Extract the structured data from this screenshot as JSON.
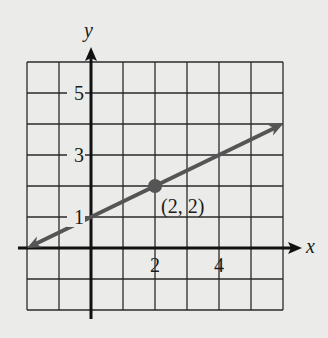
{
  "chart_data": {
    "type": "line",
    "title": "",
    "xlabel": "x",
    "ylabel": "y",
    "xlim": [
      -2,
      6
    ],
    "ylim": [
      -2,
      6
    ],
    "grid": true,
    "x_ticks": [
      {
        "value": 2,
        "label": "2"
      },
      {
        "value": 4,
        "label": "4"
      }
    ],
    "y_ticks": [
      {
        "value": 1,
        "label": "1"
      },
      {
        "value": 3,
        "label": "3"
      },
      {
        "value": 5,
        "label": "5"
      }
    ],
    "series": [
      {
        "name": "line",
        "x": [
          -2,
          6
        ],
        "y": [
          0,
          4
        ],
        "equation": "y = 0.5x + 1",
        "arrows": "both",
        "color": "#555555"
      }
    ],
    "points": [
      {
        "x": 2,
        "y": 2,
        "label": "(2, 2)"
      }
    ]
  },
  "colors": {
    "background": "#ebebe9",
    "grid": "#2a2a2a",
    "axis": "#111111",
    "line": "#555555"
  }
}
